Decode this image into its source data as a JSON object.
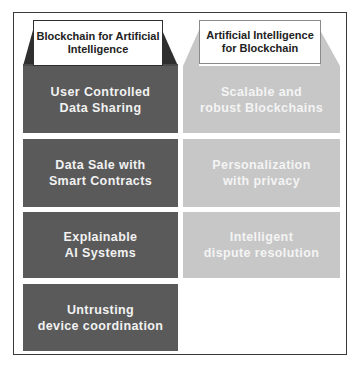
{
  "diagram": {
    "left_column": {
      "title": "Blockchain for Artificial\nIntelligence",
      "color": "#5a5a5a",
      "items": [
        {
          "label": "User  Controlled\nData  Sharing"
        },
        {
          "label": "Data Sale with\nSmart Contracts"
        },
        {
          "label": "Explainable\nAI Systems"
        },
        {
          "label": "Untrusting\ndevice  coordination"
        }
      ]
    },
    "right_column": {
      "title": "Artificial Intelligence\nfor Blockchain",
      "color": "#c7c7c7",
      "items": [
        {
          "label": "Scalable and\nrobust Blockchains"
        },
        {
          "label": "Personalization\nwith privacy"
        },
        {
          "label": "Intelligent\ndispute resolution"
        }
      ]
    }
  }
}
